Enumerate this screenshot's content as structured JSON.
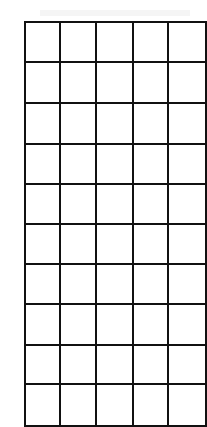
{
  "grid": {
    "rows": 10,
    "visible_columns": 5,
    "column_widths": [
      37,
      37,
      39,
      37,
      40
    ],
    "row_heights": [
      38,
      39,
      39,
      38,
      38,
      38,
      38,
      39,
      37,
      40
    ],
    "line_color": "#111111",
    "cells": [
      [
        "",
        "",
        "",
        "",
        ""
      ],
      [
        "",
        "",
        "",
        "",
        ""
      ],
      [
        "",
        "",
        "",
        "",
        ""
      ],
      [
        "",
        "",
        "",
        "",
        ""
      ],
      [
        "",
        "",
        "",
        "",
        ""
      ],
      [
        "",
        "",
        "",
        "",
        ""
      ],
      [
        "",
        "",
        "",
        "",
        ""
      ],
      [
        "",
        "",
        "",
        "",
        ""
      ],
      [
        "",
        "",
        "",
        "",
        ""
      ],
      [
        "",
        "",
        "",
        "",
        ""
      ]
    ]
  }
}
